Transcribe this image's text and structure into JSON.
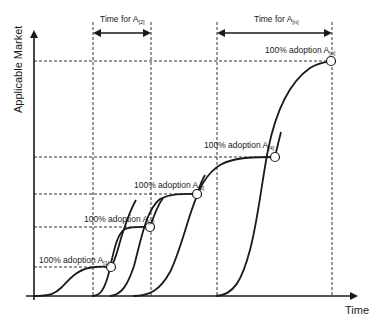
{
  "diagram": {
    "y_axis_label": "Applicable Market",
    "x_axis_label": "Time",
    "time_spans": [
      {
        "label": "Time for A",
        "subscript": "[2]"
      },
      {
        "label": "Time for A",
        "subscript": "[n]"
      }
    ],
    "adoption_labels": [
      {
        "label": "100% adoption A",
        "subscript": "[1]"
      },
      {
        "label": "100% adoption A",
        "subscript": "[2]"
      },
      {
        "label": "100% adoption A",
        "subscript": "[3]"
      },
      {
        "label": "100% adoption A",
        "subscript": "[4]"
      },
      {
        "label": "100% adoption A",
        "subscript": "[n]"
      }
    ],
    "colors": {
      "line": "#1a1a1a",
      "dashed": "#333333",
      "background": "#ffffff"
    }
  }
}
